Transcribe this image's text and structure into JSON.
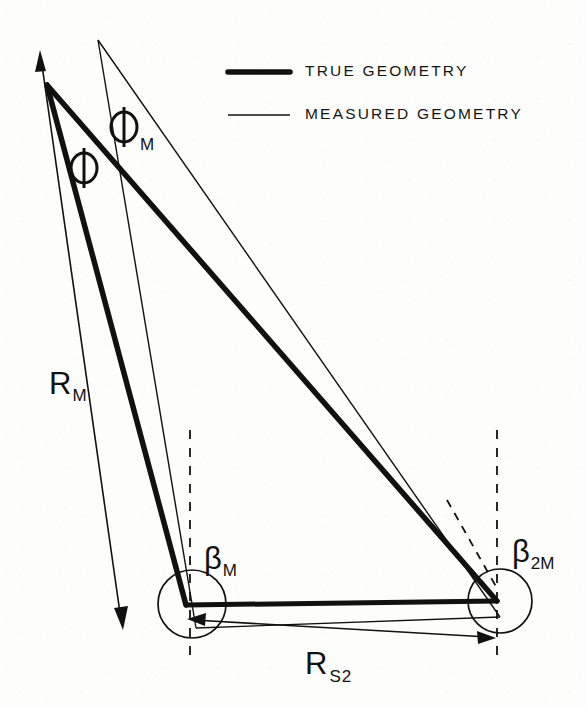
{
  "figure": {
    "stroke_color": "#111111",
    "background_color": "#fdfdfb",
    "thick_line_width": 5.5,
    "thin_line_width": 1.2
  },
  "legend": {
    "items": [
      {
        "label": "TRUE GEOMETRY",
        "style": "thick",
        "line_width": 5.5
      },
      {
        "label": "MEASURED GEOMETRY",
        "style": "thin",
        "line_width": 1.4
      }
    ]
  },
  "labels": {
    "phi": {
      "text": "Φ",
      "subscript": ""
    },
    "phi_m": {
      "text": "Φ",
      "subscript": "M"
    },
    "beta_m": {
      "text": "β",
      "subscript": "M"
    },
    "beta_2m": {
      "text": "β",
      "subscript": "2M"
    },
    "r_m": {
      "text": "R",
      "subscript": "M"
    },
    "r_s2": {
      "text": "R",
      "subscript": "S2"
    }
  },
  "geometry": {
    "true_triangle": {
      "apex": [
        47,
        85
      ],
      "left_vertex": [
        186,
        605
      ],
      "right_vertex": [
        497,
        601
      ]
    },
    "measured_triangle": {
      "apex": [
        98,
        40
      ],
      "left_vertex": [
        196,
        628
      ],
      "right_vertex": [
        500,
        617
      ]
    },
    "range_arrow": {
      "from": [
        40,
        52
      ],
      "to": [
        122,
        628
      ]
    },
    "baseline_dimension": {
      "from": [
        190,
        620
      ],
      "to": [
        494,
        637
      ]
    },
    "dashed_vertical_left": {
      "x": 190,
      "y_top": 430,
      "y_bottom": 655
    },
    "dashed_vertical_right": {
      "x": 497,
      "y_top": 430,
      "y_bottom": 655
    },
    "vertex_circle_left": {
      "cx": 192,
      "cy": 604,
      "r": 34
    },
    "vertex_circle_right": {
      "cx": 500,
      "cy": 601,
      "r": 32
    }
  }
}
